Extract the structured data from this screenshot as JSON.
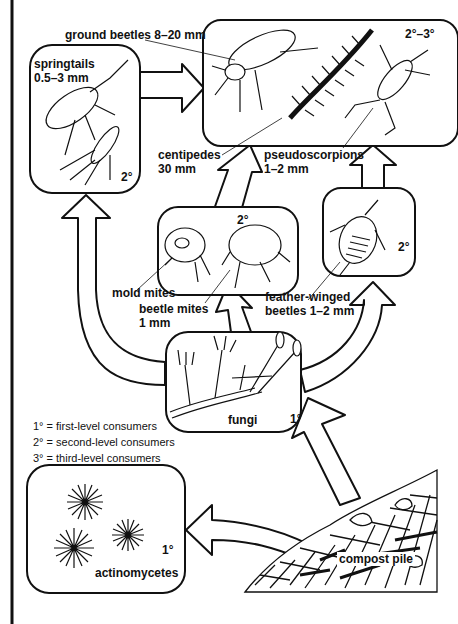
{
  "diagram": {
    "type": "food-web",
    "colors": {
      "ink": "#111111",
      "background": "#ffffff"
    }
  },
  "nodes": {
    "springtails": {
      "name": "springtails",
      "size": "0.5–3 mm",
      "level": "2°"
    },
    "predators": {
      "level": "2°–3°",
      "ground_beetles": "ground beetles 8–20 mm",
      "centipedes": {
        "name": "centipedes",
        "size": "30 mm"
      },
      "pseudoscorpions": {
        "name": "pseudoscorpions",
        "size": "1–2 mm"
      }
    },
    "mites": {
      "level": "2°",
      "mold_mites": "mold mites",
      "beetle_mites": {
        "name": "beetle mites",
        "size": "1 mm"
      }
    },
    "feather_winged": {
      "line1": "feather-winged",
      "line2": "beetles 1–2 mm",
      "level": "2°"
    },
    "fungi": {
      "name": "fungi",
      "level": "1°"
    },
    "actinomycetes": {
      "name": "actinomycetes",
      "level": "1°"
    },
    "compost": {
      "name": "compost pile"
    }
  },
  "legend": {
    "items": [
      "1° = first-level consumers",
      "2° = second-level consumers",
      "3° = third-level consumers"
    ]
  },
  "edges": [
    {
      "from": "compost pile",
      "to": "fungi"
    },
    {
      "from": "compost pile",
      "to": "actinomycetes"
    },
    {
      "from": "fungi",
      "to": "springtails"
    },
    {
      "from": "fungi",
      "to": "mold mites / beetle mites"
    },
    {
      "from": "fungi",
      "to": "feather-winged beetles"
    },
    {
      "from": "springtails",
      "to": "ground beetles / centipedes / pseudoscorpions"
    },
    {
      "from": "mold mites / beetle mites",
      "to": "ground beetles / centipedes / pseudoscorpions"
    },
    {
      "from": "feather-winged beetles",
      "to": "ground beetles / centipedes / pseudoscorpions"
    }
  ]
}
